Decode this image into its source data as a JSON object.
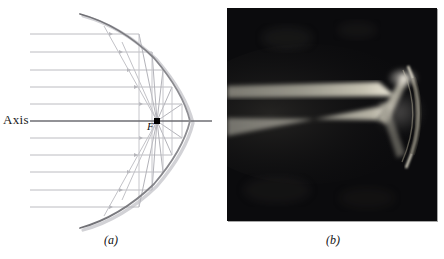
{
  "figure": {
    "type": "optics-figure",
    "panels": [
      {
        "id": "a",
        "caption": "(a)",
        "kind": "ray-diagram",
        "subject": "parabolic mirror focusing parallel rays",
        "labels": {
          "axis": "Axis",
          "focus": "F"
        },
        "geometry": {
          "focus_point": {
            "x": 157,
            "y": 121
          },
          "vertex_point": {
            "x": 190,
            "y": 121
          },
          "axis_y": 121,
          "parabola_top": {
            "x": 80,
            "y": 14
          },
          "parabola_bottom": {
            "x": 80,
            "y": 228
          },
          "incoming_ray_count": 10,
          "incoming_ray_x_start": 30,
          "ray_y_values": [
            34,
            52,
            70,
            87,
            104,
            138,
            155,
            172,
            190,
            207
          ]
        },
        "colors": {
          "ray": "#b9b9bd",
          "axis": "#6e6e73",
          "mirror": "#7b7b80",
          "mirror_shadow": "#c9c9cd",
          "focus_marker": "#000000",
          "text": "#111111"
        }
      },
      {
        "id": "b",
        "caption": "(b)",
        "kind": "photograph",
        "subject": "laser light beams reflecting from a concave mirror",
        "colors": {
          "background": "#0b0b0d",
          "beam": "#c6c2b4",
          "mirror_rim": "#d8d4c6"
        }
      }
    ]
  }
}
